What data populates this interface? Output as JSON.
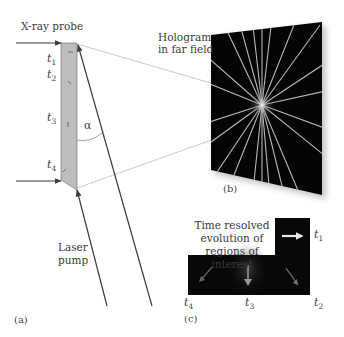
{
  "panel_a": {
    "letter": "(a)",
    "xray_label": "X-ray probe",
    "laser_label_line1": "Laser",
    "laser_label_line2": "pump",
    "angle_label": "α",
    "time_labels": [
      {
        "t": "t",
        "sub": "1"
      },
      {
        "t": "t",
        "sub": "2"
      },
      {
        "t": "t",
        "sub": "3"
      },
      {
        "t": "t",
        "sub": "4"
      }
    ]
  },
  "panel_b": {
    "letter": "(b)",
    "title_line1": "Hologram",
    "title_line2": "in far field"
  },
  "panel_c": {
    "letter": "(c)",
    "caption_line1": "Time resolved",
    "caption_line2": "evolution of",
    "caption_line3": "regions of interest",
    "time_labels": [
      {
        "t": "t",
        "sub": "1"
      },
      {
        "t": "t",
        "sub": "2"
      },
      {
        "t": "t",
        "sub": "3"
      },
      {
        "t": "t",
        "sub": "4"
      }
    ]
  },
  "colors": {
    "line": "#3a3a3a",
    "sample": "#b8b8b8",
    "hologram_bg": "#050505",
    "thin_line": "#b0b0b0"
  }
}
